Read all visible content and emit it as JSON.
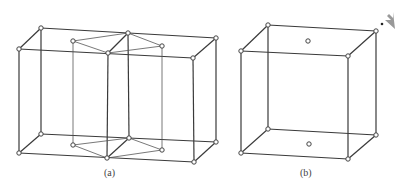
{
  "figure": {
    "panels": [
      {
        "id": "a",
        "caption": "(a)",
        "description": "Two adjacent unit cells with an inscribed hexagonal-prism-like sub-cell"
      },
      {
        "id": "b",
        "caption": "(b)",
        "description": "Single unit cell with face-centered atoms on top and bottom faces"
      }
    ],
    "colors": {
      "line": "#3a3a3a",
      "atom_fill": "#ffffff",
      "atom_stroke": "#444444"
    },
    "corner_icon": "cursor-arrow-icon"
  }
}
